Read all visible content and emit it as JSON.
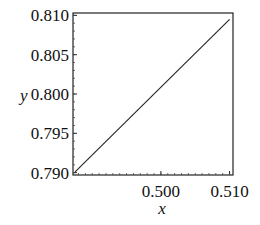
{
  "chart_data": {
    "type": "line",
    "title": "",
    "xlabel": "x",
    "ylabel": "y",
    "xlim": [
      0.4872,
      0.5105
    ],
    "ylim": [
      0.7897,
      0.8103
    ],
    "x_ticks": [
      0.5,
      0.51
    ],
    "x_tick_labels": [
      "0.500",
      "0.510"
    ],
    "y_ticks": [
      0.79,
      0.795,
      0.8,
      0.805,
      0.81
    ],
    "y_tick_labels": [
      "0.790",
      "0.795",
      "0.800",
      "0.805",
      "0.810"
    ],
    "grid": false,
    "legend": null,
    "series": [
      {
        "name": "y",
        "x": [
          0.4875,
          0.51
        ],
        "y": [
          0.7901,
          0.8095
        ]
      }
    ]
  },
  "axes": {
    "xlabel": "x",
    "ylabel": "y"
  }
}
